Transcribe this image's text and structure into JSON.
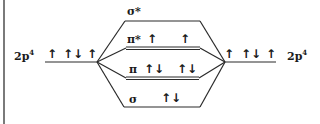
{
  "diagram": {
    "left_atom": {
      "label": "2p",
      "superscript": "4",
      "electrons": [
        "↑",
        "↑↓",
        "↑"
      ]
    },
    "right_atom": {
      "label": "2p",
      "superscript": "4",
      "electrons": [
        "↑",
        "↑↓",
        "↑"
      ]
    },
    "orbitals": [
      {
        "name": "sigma_star",
        "label": "σ*",
        "electrons": []
      },
      {
        "name": "pi_star",
        "label": "π*",
        "electrons": [
          "↑",
          "↑"
        ]
      },
      {
        "name": "pi",
        "label": "π",
        "electrons": [
          "↑↓",
          "↑↓"
        ]
      },
      {
        "name": "sigma",
        "label": "σ",
        "electrons": [
          "↑↓"
        ]
      }
    ]
  }
}
